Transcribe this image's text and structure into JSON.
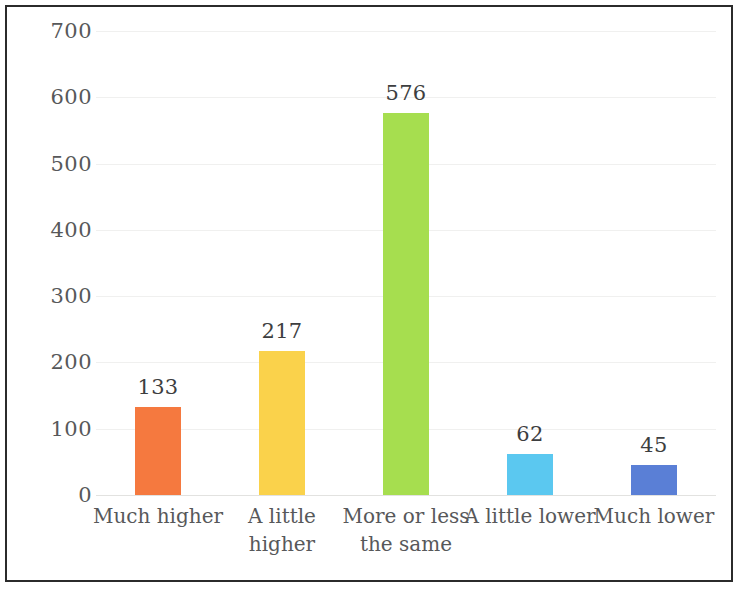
{
  "chart_data": {
    "type": "bar",
    "title": "",
    "subtitle": "",
    "xlabel": "",
    "ylabel": "",
    "categories": [
      "Much higher",
      "A little\nhigher",
      "More or less\nthe same",
      "A little lower",
      "Much lower"
    ],
    "values": [
      133,
      217,
      576,
      62,
      45
    ],
    "value_labels": [
      "133",
      "217",
      "576",
      "62",
      "45"
    ],
    "bar_colors": [
      "#F5793F",
      "#FAD24B",
      "#A6DE4F",
      "#5BC8F0",
      "#5A7FD6"
    ],
    "ylim": [
      0,
      700
    ],
    "ytick_values": [
      700,
      600,
      500,
      400,
      300,
      200,
      100,
      0
    ],
    "ytick_labels": [
      "700",
      "600",
      "500",
      "400",
      "300",
      "200",
      "100",
      "0"
    ],
    "grid": true,
    "grid_axis": "y",
    "legend": false,
    "legend_position": "none",
    "annotations": []
  },
  "style": {
    "background": "#ffffff",
    "frame_color": "#2b2b2b",
    "gridline_color": "#f0f0ef",
    "axis_line_color": "#e2e2e0",
    "tick_text_color": "#57585a",
    "value_text_color": "#3d3e40"
  }
}
